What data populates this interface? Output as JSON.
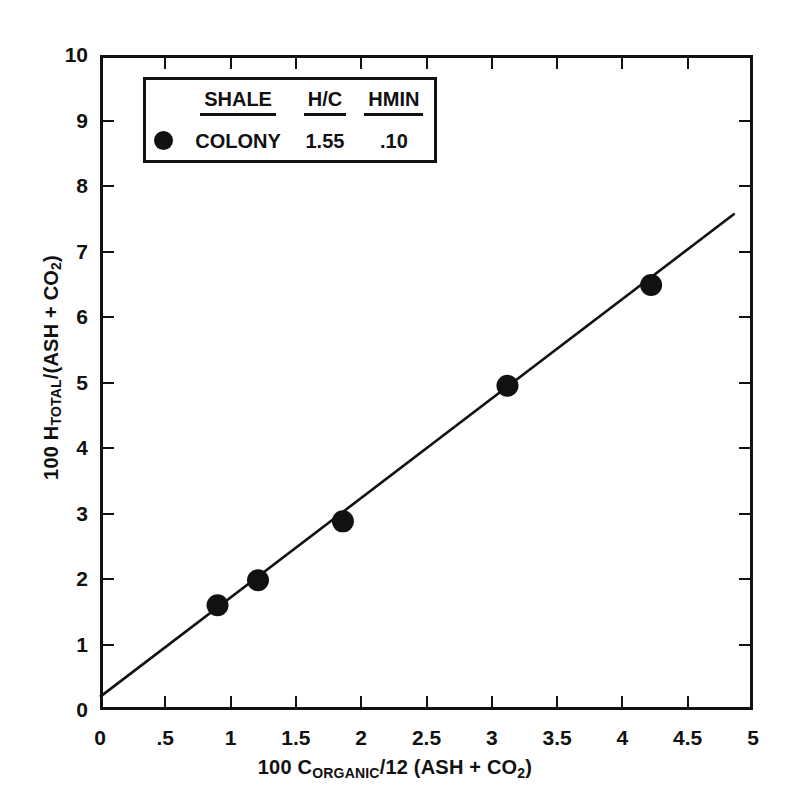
{
  "chart_data": {
    "type": "scatter",
    "title": "",
    "xlabel": "100 CORGANIC/12 (ASH + CO2)",
    "ylabel": "100 HTOTAL/(ASH + CO2)",
    "xlim": [
      0,
      5
    ],
    "ylim": [
      0,
      10
    ],
    "grid": false,
    "x_ticks": [
      0,
      0.5,
      1,
      1.5,
      2,
      2.5,
      3,
      3.5,
      4,
      4.5,
      5
    ],
    "x_tick_labels": [
      "0",
      ".5",
      "1",
      "1.5",
      "2",
      "2.5",
      "3",
      "3.5",
      "4",
      "4.5",
      "5"
    ],
    "y_ticks": [
      0,
      1,
      2,
      3,
      4,
      5,
      6,
      7,
      8,
      9,
      10
    ],
    "y_tick_labels": [
      "0",
      "1",
      "2",
      "3",
      "4",
      "5",
      "6",
      "7",
      "8",
      "9",
      "10"
    ],
    "series": [
      {
        "name": "COLONY",
        "marker": "filled-circle",
        "color": "#111111",
        "x": [
          0.9,
          1.21,
          1.86,
          3.12,
          4.22
        ],
        "y": [
          1.6,
          1.98,
          2.88,
          4.95,
          6.49
        ]
      }
    ],
    "fit_line": {
      "name": "regression-line",
      "x_start": 0.0,
      "y_start": 0.2,
      "x_end": 4.86,
      "y_end": 7.58,
      "slope": 1.52,
      "intercept": 0.2,
      "color": "#111111"
    },
    "legend_position": "top-left"
  },
  "axes": {
    "x_title_prefix": "100 C",
    "x_title_sub": "ORGANIC",
    "x_title_mid": "/12 (ASH + CO",
    "x_title_sub2": "2",
    "x_title_end": ")",
    "y_title_prefix": "100 H",
    "y_title_sub": "TOTAL",
    "y_title_mid": "/(ASH + CO",
    "y_title_sub2": "2",
    "y_title_end": ")"
  },
  "legend": {
    "headers": [
      "SHALE",
      "H/C",
      "HMIN"
    ],
    "rows": [
      {
        "marker": "filled-circle",
        "shale": "COLONY",
        "hc": "1.55",
        "hmin": ".10"
      }
    ]
  }
}
